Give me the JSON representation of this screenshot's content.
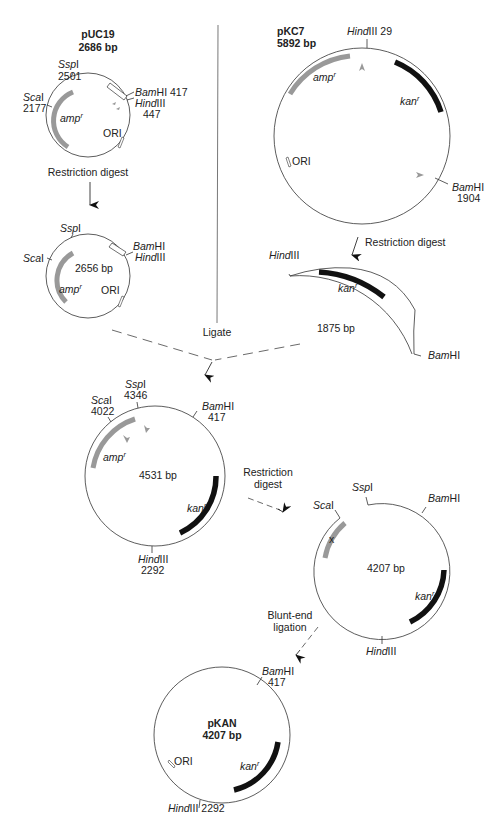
{
  "figure": {
    "colors": {
      "amp": "#999999",
      "kan": "#111111",
      "line": "#333333"
    }
  },
  "puc19": {
    "name": "pUC19",
    "size": "2686 bp",
    "sites": {
      "sspi": {
        "enzyme": "Ssp",
        "suffix": "I",
        "pos": "2501"
      },
      "scai": {
        "enzyme": "Sca",
        "suffix": "I",
        "pos": "2177"
      },
      "bamhi": {
        "enzyme": "Bam",
        "suffix": "HI",
        "pos": "417"
      },
      "hindiii": {
        "enzyme": "Hind",
        "suffix": "III",
        "pos": "447"
      }
    },
    "genes": {
      "amp": "amp",
      "amp_sup": "r"
    },
    "ori": "ORI"
  },
  "step1": {
    "label": "Restriction digest"
  },
  "puc19_cut": {
    "size": "2656 bp",
    "sites": {
      "sspi": {
        "enzyme": "Ssp",
        "suffix": "I"
      },
      "scai": {
        "enzyme": "Sca",
        "suffix": "I"
      },
      "bamhi": {
        "enzyme": "Bam",
        "suffix": "HI"
      },
      "hindiii": {
        "enzyme": "Hind",
        "suffix": "III"
      }
    },
    "genes": {
      "amp": "amp",
      "amp_sup": "r"
    },
    "ori": "ORI"
  },
  "pkc7": {
    "name": "pKC7",
    "size": "5892 bp",
    "sites": {
      "hindiii": {
        "enzyme": "Hind",
        "suffix": "III",
        "pos": "29"
      },
      "bamhi": {
        "enzyme": "Bam",
        "suffix": "HI",
        "pos": "1904"
      }
    },
    "genes": {
      "amp": "amp",
      "amp_sup": "r",
      "kan": "kan",
      "kan_sup": "r"
    },
    "ori": "ORI"
  },
  "step2": {
    "label": "Restriction digest"
  },
  "fragment": {
    "size": "1875 bp",
    "sites": {
      "hindiii": {
        "enzyme": "Hind",
        "suffix": "III"
      },
      "bamhi": {
        "enzyme": "Bam",
        "suffix": "HI"
      }
    },
    "genes": {
      "kan": "kan",
      "kan_sup": "r"
    }
  },
  "ligate": {
    "label": "Ligate"
  },
  "intermediate": {
    "size": "4531 bp",
    "sites": {
      "scai": {
        "enzyme": "Sca",
        "suffix": "I",
        "pos": "4022"
      },
      "sspi": {
        "enzyme": "Ssp",
        "suffix": "I",
        "pos": "4346"
      },
      "bamhi": {
        "enzyme": "Bam",
        "suffix": "HI",
        "pos": "417"
      },
      "hindiii": {
        "enzyme": "Hind",
        "suffix": "III",
        "pos": "2292"
      }
    },
    "genes": {
      "amp": "amp",
      "amp_sup": "r",
      "kan": "kan",
      "kan_sup": "r"
    }
  },
  "step3": {
    "label_line1": "Restriction",
    "label_line2": "digest"
  },
  "linear4207": {
    "size": "4207 bp",
    "sites": {
      "scai": {
        "enzyme": "Sca",
        "suffix": "I"
      },
      "sspi": {
        "enzyme": "Ssp",
        "suffix": "I"
      },
      "bamhi": {
        "enzyme": "Bam",
        "suffix": "HI"
      },
      "hindiii": {
        "enzyme": "Hind",
        "suffix": "III"
      }
    },
    "genes": {
      "kan": "kan",
      "kan_sup": "r"
    },
    "mark": "x"
  },
  "step4": {
    "label_line1": "Blunt-end",
    "label_line2": "ligation"
  },
  "pkan": {
    "name": "pKAN",
    "size": "4207 bp",
    "sites": {
      "bamhi": {
        "enzyme": "Bam",
        "suffix": "HI",
        "pos": "417"
      },
      "hindiii": {
        "enzyme": "Hind",
        "suffix": "III",
        "pos": "2292"
      }
    },
    "genes": {
      "kan": "kan",
      "kan_sup": "r"
    },
    "ori": "ORI"
  }
}
